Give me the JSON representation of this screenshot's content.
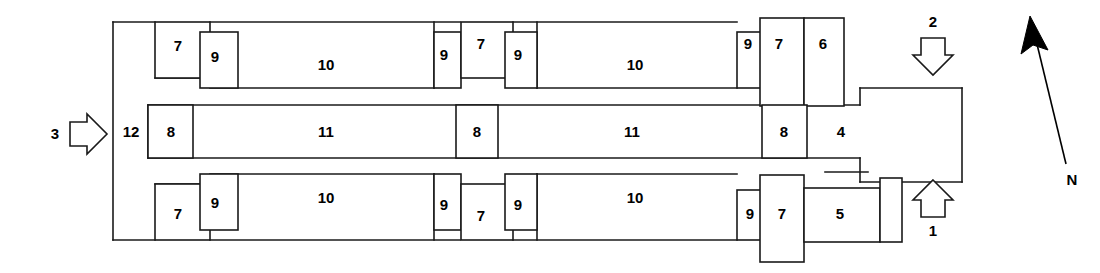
{
  "figure": {
    "type": "floor-plan-diagram",
    "background": "#ffffff",
    "stroke_color": "#1a1a1a",
    "fill_color": "#ffffff"
  },
  "compass": {
    "label": "N"
  },
  "flow_arrows": [
    {
      "id": "arrow-1",
      "label": "1",
      "direction": "up"
    },
    {
      "id": "arrow-2",
      "label": "2",
      "direction": "down"
    },
    {
      "id": "arrow-3",
      "label": "3",
      "direction": "right"
    }
  ],
  "zones": {
    "top_band": [
      {
        "id": "top-7-left",
        "label": "7"
      },
      {
        "id": "top-9-left",
        "label": "9"
      },
      {
        "id": "top-10-left",
        "label": "10"
      },
      {
        "id": "top-9-midleft",
        "label": "9"
      },
      {
        "id": "top-7-mid",
        "label": "7"
      },
      {
        "id": "top-9-midright",
        "label": "9"
      },
      {
        "id": "top-10-right",
        "label": "10"
      },
      {
        "id": "top-9-right",
        "label": "9"
      },
      {
        "id": "top-7-right",
        "label": "7"
      },
      {
        "id": "top-6",
        "label": "6"
      }
    ],
    "middle_band": [
      {
        "id": "mid-12",
        "label": "12"
      },
      {
        "id": "mid-8-left",
        "label": "8"
      },
      {
        "id": "mid-11-left",
        "label": "11"
      },
      {
        "id": "mid-8-mid",
        "label": "8"
      },
      {
        "id": "mid-11-right",
        "label": "11"
      },
      {
        "id": "mid-8-right",
        "label": "8"
      },
      {
        "id": "mid-4",
        "label": "4"
      }
    ],
    "bottom_band": [
      {
        "id": "bot-7-left",
        "label": "7"
      },
      {
        "id": "bot-9-left",
        "label": "9"
      },
      {
        "id": "bot-10-left",
        "label": "10"
      },
      {
        "id": "bot-9-midleft",
        "label": "9"
      },
      {
        "id": "bot-7-mid",
        "label": "7"
      },
      {
        "id": "bot-9-midright",
        "label": "9"
      },
      {
        "id": "bot-10-right",
        "label": "10"
      },
      {
        "id": "bot-9-right",
        "label": "9"
      },
      {
        "id": "bot-7-right",
        "label": "7"
      },
      {
        "id": "bot-5",
        "label": "5"
      }
    ]
  }
}
